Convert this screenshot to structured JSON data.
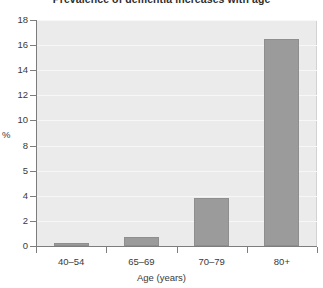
{
  "chart_data": {
    "type": "bar",
    "title": "Prevalence of dementia increases with age",
    "title_clipped": true,
    "xlabel": "Age (years)",
    "ylabel": "%",
    "categories": [
      "40–54",
      "65–69",
      "70–79",
      "80+"
    ],
    "values": [
      0.2,
      0.7,
      3.8,
      16.5
    ],
    "ylim": [
      0,
      18
    ],
    "ytick_labels": [
      "0",
      "2",
      "4",
      "5",
      "8",
      "10",
      "12",
      "14",
      "16",
      "18"
    ],
    "ytick_values": [
      0,
      2,
      4,
      6,
      8,
      10,
      12,
      14,
      16,
      18
    ],
    "grid": true,
    "grid_color": "#f7f7f7",
    "legend": null,
    "bar_color": "#9b9b9b",
    "bar_edge_color": "#8e8e8e",
    "plot_background": "#ebebeb",
    "axis_color": "#7d7d7d",
    "page_background": "#ffffff"
  }
}
